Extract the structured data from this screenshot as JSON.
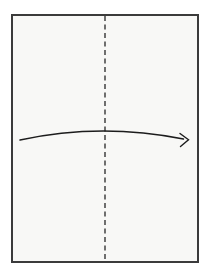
{
  "canvas": {
    "width": 208,
    "height": 269,
    "background_color": "#ffffff"
  },
  "diagram": {
    "kind": "origami-fold-step",
    "paper": {
      "x": 12,
      "y": 15,
      "width": 186,
      "height": 247,
      "fill_color": "#f8f8f6",
      "edge_color": "#3b3b3b",
      "edge_width": 2
    },
    "fold_line": {
      "orientation": "vertical",
      "style": "dashed",
      "meaning": "valley-fold",
      "x": 105,
      "y1": 16,
      "y2": 261,
      "color": "#4d4d4d",
      "width": 1.6,
      "dash_pattern": "5 3.5"
    },
    "arrow": {
      "direction": "left-to-right",
      "color": "#1c1c1c",
      "width": 1.4,
      "shaft_path": "M 20 140 Q 100 122.5 183.5 139",
      "head_path": "M 180 133.5 L 188.5 139.8 L 180.5 146.5"
    }
  }
}
